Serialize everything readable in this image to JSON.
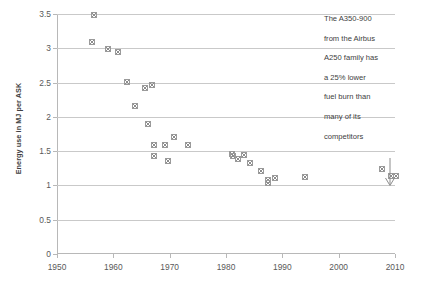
{
  "chart_data": {
    "type": "scatter",
    "title": "",
    "xlabel": "",
    "ylabel": "Energy use in MJ per ASK",
    "xlim": [
      1950,
      2010
    ],
    "ylim": [
      0,
      3.5
    ],
    "xticks": [
      1950,
      1960,
      1970,
      1980,
      1990,
      2000,
      2010
    ],
    "yticks": [
      0,
      0.5,
      1,
      1.5,
      2,
      2.5,
      3,
      3.5
    ],
    "ytick_labels": [
      "0",
      "0.5",
      "1",
      "1.5",
      "2",
      "2.5",
      "3",
      "3.5"
    ],
    "xtick_labels": [
      "1950",
      "1960",
      "1970",
      "1980",
      "1990",
      "2000",
      "2010"
    ],
    "grid": true,
    "legend": "none",
    "marker": "x-square",
    "marker_color": "#8c8c8c",
    "series": [
      {
        "name": "Aircraft energy intensity",
        "points": [
          [
            1956.4,
            3.5
          ],
          [
            1956.2,
            3.1
          ],
          [
            1958.9,
            3.0
          ],
          [
            1960.7,
            2.96
          ],
          [
            1962.4,
            2.51
          ],
          [
            1963.7,
            2.17
          ],
          [
            1965.6,
            2.43
          ],
          [
            1966.7,
            2.47
          ],
          [
            1966.0,
            1.91
          ],
          [
            1967.1,
            1.6
          ],
          [
            1967.1,
            1.44
          ],
          [
            1969.0,
            1.6
          ],
          [
            1969.6,
            1.36
          ],
          [
            1970.6,
            1.72
          ],
          [
            1973.2,
            1.6
          ],
          [
            1981.0,
            1.46
          ],
          [
            1981.2,
            1.43
          ],
          [
            1982.1,
            1.4
          ],
          [
            1983.1,
            1.45
          ],
          [
            1984.2,
            1.33
          ],
          [
            1986.2,
            1.22
          ],
          [
            1987.3,
            1.09
          ],
          [
            1987.4,
            1.04
          ],
          [
            1988.6,
            1.12
          ],
          [
            1993.9,
            1.13
          ],
          [
            2007.6,
            1.24
          ],
          [
            2009.2,
            1.14
          ],
          [
            2010.0,
            1.14
          ]
        ]
      }
    ],
    "annotation": {
      "lines": [
        "The A350-900",
        "from the Airbus",
        "A250 family has",
        "a 25% lower",
        "fuel burn than",
        "many of its",
        "competitors"
      ],
      "arrow": "down-arrow"
    }
  }
}
